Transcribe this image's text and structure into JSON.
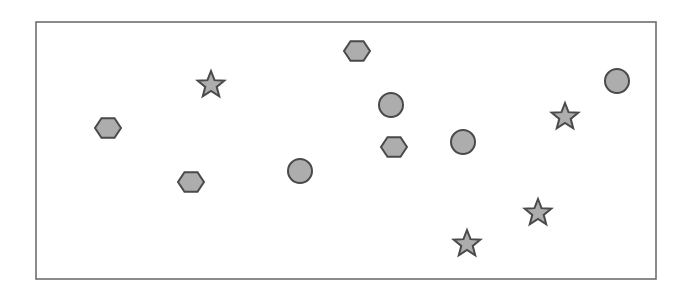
{
  "canvas": {
    "width": 692,
    "height": 295,
    "background": "#ffffff"
  },
  "frame": {
    "x": 36,
    "y": 22,
    "width": 620,
    "height": 257,
    "stroke": "#6e6e6e",
    "stroke_width": 1.6,
    "fill": "#ffffff"
  },
  "style": {
    "shape_fill": "#adadad",
    "shape_stroke": "#4a4a4a",
    "shape_stroke_width": 2
  },
  "shapes": [
    {
      "id": "hexagon-1",
      "type": "hexagon",
      "cx": 108,
      "cy": 128,
      "r": 13
    },
    {
      "id": "hexagon-2",
      "type": "hexagon",
      "cx": 191,
      "cy": 182,
      "r": 13
    },
    {
      "id": "hexagon-3",
      "type": "hexagon",
      "cx": 357,
      "cy": 51,
      "r": 13
    },
    {
      "id": "hexagon-4",
      "type": "hexagon",
      "cx": 394,
      "cy": 147,
      "r": 13
    },
    {
      "id": "circle-1",
      "type": "circle",
      "cx": 300,
      "cy": 171,
      "r": 12
    },
    {
      "id": "circle-2",
      "type": "circle",
      "cx": 391,
      "cy": 105,
      "r": 12
    },
    {
      "id": "circle-3",
      "type": "circle",
      "cx": 463,
      "cy": 142,
      "r": 12
    },
    {
      "id": "circle-4",
      "type": "circle",
      "cx": 617,
      "cy": 81,
      "r": 12
    },
    {
      "id": "star-1",
      "type": "star",
      "cx": 211,
      "cy": 85,
      "r": 14,
      "inner_r": 6
    },
    {
      "id": "star-2",
      "type": "star",
      "cx": 565,
      "cy": 117,
      "r": 14,
      "inner_r": 6
    },
    {
      "id": "star-3",
      "type": "star",
      "cx": 538,
      "cy": 213,
      "r": 14,
      "inner_r": 6
    },
    {
      "id": "star-4",
      "type": "star",
      "cx": 467,
      "cy": 244,
      "r": 14,
      "inner_r": 6
    }
  ]
}
